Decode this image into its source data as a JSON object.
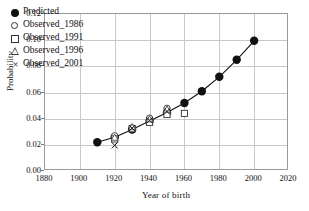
{
  "chart_data": {
    "type": "scatter",
    "title": "",
    "xlabel": "Year of birth",
    "ylabel": "Probability",
    "xlim": [
      1880,
      2020
    ],
    "ylim": [
      0.0,
      0.12
    ],
    "xticks": [
      1880,
      1900,
      1920,
      1940,
      1960,
      1980,
      2000,
      2020
    ],
    "xtick_labels": [
      "1880",
      "1900",
      "1920",
      "1940",
      "1960",
      "1980",
      "2000",
      "2020"
    ],
    "yticks": [
      0.0,
      0.02,
      0.04,
      0.06,
      0.08,
      0.1,
      0.12
    ],
    "ytick_labels": [
      "0.00",
      "0.02",
      "0.04",
      "0.06",
      "0.08",
      "0.10",
      "0.12"
    ],
    "grid": true,
    "legend_position": "top-left",
    "series": [
      {
        "name": "Predicted",
        "marker": "filled-circle",
        "line": true,
        "color": "#111111",
        "x": [
          1910,
          1920,
          1930,
          1940,
          1950,
          1960,
          1970,
          1980,
          1990,
          2000
        ],
        "values": [
          0.022,
          0.0258,
          0.0317,
          0.0382,
          0.0447,
          0.052,
          0.061,
          0.072,
          0.085,
          0.0995
        ]
      },
      {
        "name": "Observed_1986",
        "marker": "open-circle",
        "line": false,
        "color": "#333333",
        "x": [
          1920,
          1930,
          1940,
          1950
        ],
        "values": [
          0.027,
          0.033,
          0.0405,
          0.048
        ]
      },
      {
        "name": "Observed_1991",
        "marker": "open-square",
        "line": false,
        "color": "#333333",
        "x": [
          1920,
          1930,
          1940,
          1950,
          1960
        ],
        "values": [
          0.0245,
          0.0323,
          0.0372,
          0.0432,
          0.044
        ]
      },
      {
        "name": "Observed_1996",
        "marker": "open-triangle",
        "line": false,
        "color": "#444444",
        "x": [
          1920,
          1930,
          1940,
          1950
        ],
        "values": [
          0.0255,
          0.0335,
          0.0395,
          0.047
        ]
      },
      {
        "name": "Observed_2001",
        "marker": "cross",
        "line": false,
        "color": "#111111",
        "x": [
          1920,
          1930,
          1940,
          1950
        ],
        "values": [
          0.0196,
          0.0328,
          0.0388,
          0.0455
        ]
      }
    ]
  },
  "legend": {
    "items": [
      {
        "label": "Predicted",
        "marker": "filled-circle"
      },
      {
        "label": "Observed_1986",
        "marker": "open-circle"
      },
      {
        "label": "Observed_1991",
        "marker": "open-square"
      },
      {
        "label": "Observed_1996",
        "marker": "open-triangle"
      },
      {
        "label": "Observed_2001",
        "marker": "cross"
      }
    ],
    "cross_glyph": "×"
  },
  "colors": {
    "grid": "#c8c8c8",
    "frame": "#9a9a9a",
    "ink": "#111111",
    "background": "#ffffff"
  }
}
